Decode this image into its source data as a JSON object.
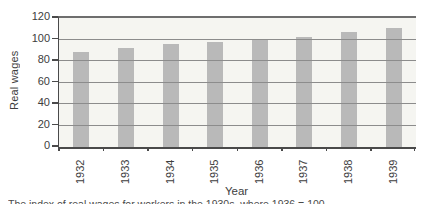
{
  "chart_data": {
    "type": "bar",
    "categories": [
      "1932",
      "1933",
      "1934",
      "1935",
      "1936",
      "1937",
      "1938",
      "1939"
    ],
    "values": [
      88,
      92,
      96,
      98,
      100,
      102,
      107,
      111
    ],
    "title": "",
    "xlabel": "Year",
    "ylabel": "Real wages",
    "ylim": [
      0,
      120
    ],
    "yticks": [
      0,
      20,
      40,
      60,
      80,
      100,
      120
    ],
    "grid": true,
    "gridlines_over_bars": true,
    "legend_position": "none"
  },
  "caption": "The index of real wages for workers in the 1930s, where 1936 = 100",
  "colors": {
    "bar": "#b9b9b9",
    "plot_bg": "#f5f5f1",
    "gridline": "#8c8c8c",
    "frame_top": "#6e6e6e",
    "axis": "#4a4a4a",
    "text": "#3d3d3d",
    "page_bg": "#ffffff"
  }
}
